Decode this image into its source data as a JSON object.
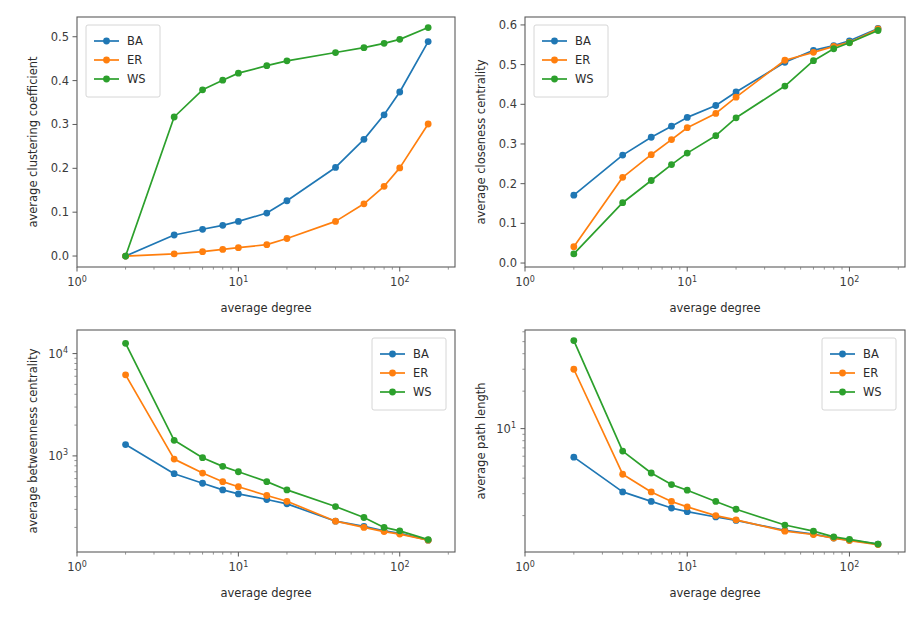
{
  "figure": {
    "background": "#ffffff",
    "width": 918,
    "height": 623,
    "layout": "2x2 grid of line plots"
  },
  "palette": {
    "BA": "#1f77b4",
    "ER": "#ff7f0e",
    "WS": "#2ca02c",
    "axis": "#5b5b5b",
    "text": "#2b2b2b"
  },
  "legend": {
    "entries": [
      "BA",
      "ER",
      "WS"
    ],
    "frame": true
  },
  "chart_data": [
    {
      "id": "clustering",
      "type": "line",
      "title": "",
      "xlabel": "average degree",
      "ylabel": "average clustering coefficient",
      "xscale": "log",
      "yscale": "linear",
      "xlim": [
        1.0,
        220.0
      ],
      "ylim": [
        -0.025,
        0.545
      ],
      "xticks": [
        1,
        10,
        100
      ],
      "xticklabels": [
        "10^0",
        "10^1",
        "10^2"
      ],
      "yticks": [
        0.0,
        0.1,
        0.2,
        0.3,
        0.4,
        0.5
      ],
      "yticklabels": [
        "0.0",
        "0.1",
        "0.2",
        "0.3",
        "0.4",
        "0.5"
      ],
      "grid": false,
      "legend_position": "upper left",
      "x": [
        2,
        4,
        6,
        8,
        10,
        15,
        20,
        40,
        60,
        80,
        100,
        150
      ],
      "series": [
        {
          "name": "BA",
          "color": "#1f77b4",
          "values": [
            0.0,
            0.048,
            0.061,
            0.07,
            0.079,
            0.098,
            0.126,
            0.202,
            0.266,
            0.322,
            0.374,
            0.489
          ]
        },
        {
          "name": "ER",
          "color": "#ff7f0e",
          "values": [
            0.0,
            0.005,
            0.01,
            0.015,
            0.019,
            0.026,
            0.04,
            0.079,
            0.119,
            0.159,
            0.201,
            0.301
          ]
        },
        {
          "name": "WS",
          "color": "#2ca02c",
          "values": [
            0.0,
            0.317,
            0.379,
            0.401,
            0.417,
            0.434,
            0.445,
            0.464,
            0.475,
            0.485,
            0.494,
            0.521
          ]
        }
      ]
    },
    {
      "id": "closeness",
      "type": "line",
      "title": "",
      "xlabel": "average degree",
      "ylabel": "average closeness centrality",
      "xscale": "log",
      "yscale": "linear",
      "xlim": [
        1.0,
        220.0
      ],
      "ylim": [
        -0.01,
        0.62
      ],
      "xticks": [
        1,
        10,
        100
      ],
      "xticklabels": [
        "10^0",
        "10^1",
        "10^2"
      ],
      "yticks": [
        0.0,
        0.1,
        0.2,
        0.3,
        0.4,
        0.5,
        0.6
      ],
      "yticklabels": [
        "0.0",
        "0.1",
        "0.2",
        "0.3",
        "0.4",
        "0.5",
        "0.6"
      ],
      "grid": false,
      "legend_position": "upper left",
      "x": [
        2,
        4,
        6,
        8,
        10,
        15,
        20,
        40,
        60,
        80,
        100,
        150
      ],
      "series": [
        {
          "name": "BA",
          "color": "#1f77b4",
          "values": [
            0.171,
            0.272,
            0.317,
            0.345,
            0.367,
            0.397,
            0.431,
            0.506,
            0.536,
            0.548,
            0.56,
            0.591
          ]
        },
        {
          "name": "ER",
          "color": "#ff7f0e",
          "values": [
            0.041,
            0.216,
            0.273,
            0.311,
            0.341,
            0.377,
            0.418,
            0.511,
            0.531,
            0.546,
            0.556,
            0.59
          ]
        },
        {
          "name": "WS",
          "color": "#2ca02c",
          "values": [
            0.023,
            0.152,
            0.208,
            0.248,
            0.277,
            0.321,
            0.366,
            0.446,
            0.51,
            0.54,
            0.555,
            0.586
          ]
        }
      ]
    },
    {
      "id": "betweenness",
      "type": "line",
      "title": "",
      "xlabel": "average degree",
      "ylabel": "average betweenness centrality",
      "xscale": "log",
      "yscale": "log",
      "xlim": [
        1.0,
        220.0
      ],
      "ylim": [
        115.0,
        17000.0
      ],
      "xticks": [
        1,
        10,
        100
      ],
      "xticklabels": [
        "10^0",
        "10^1",
        "10^2"
      ],
      "yticks": [
        1000,
        10000
      ],
      "yticklabels": [
        "10^3",
        "10^4"
      ],
      "grid": false,
      "legend_position": "upper right",
      "x": [
        2,
        4,
        6,
        8,
        10,
        15,
        20,
        40,
        60,
        80,
        100,
        150
      ],
      "series": [
        {
          "name": "BA",
          "color": "#1f77b4",
          "values": [
            1290,
            670,
            540,
            465,
            425,
            375,
            340,
            230,
            205,
            185,
            175,
            150
          ]
        },
        {
          "name": "ER",
          "color": "#ff7f0e",
          "values": [
            6200,
            930,
            680,
            560,
            500,
            410,
            360,
            230,
            200,
            182,
            172,
            150
          ]
        },
        {
          "name": "WS",
          "color": "#2ca02c",
          "values": [
            12600,
            1420,
            960,
            790,
            700,
            560,
            465,
            320,
            250,
            200,
            185,
            152
          ]
        }
      ]
    },
    {
      "id": "pathlength",
      "type": "line",
      "title": "",
      "xlabel": "average degree",
      "ylabel": "average path length",
      "xscale": "log",
      "yscale": "log",
      "xlim": [
        1.0,
        220.0
      ],
      "ylim": [
        1.02,
        62.0
      ],
      "xticks": [
        1,
        10,
        100
      ],
      "xticklabels": [
        "10^0",
        "10^1",
        "10^2"
      ],
      "yticks": [
        10
      ],
      "yticklabels": [
        "10^1"
      ],
      "grid": false,
      "legend_position": "upper right",
      "x": [
        2,
        4,
        6,
        8,
        10,
        15,
        20,
        40,
        60,
        80,
        100,
        150
      ],
      "series": [
        {
          "name": "BA",
          "color": "#1f77b4",
          "values": [
            5.9,
            3.1,
            2.6,
            2.3,
            2.15,
            1.95,
            1.83,
            1.52,
            1.42,
            1.32,
            1.27,
            1.18
          ]
        },
        {
          "name": "ER",
          "color": "#ff7f0e",
          "values": [
            30.0,
            4.3,
            3.1,
            2.6,
            2.35,
            2.0,
            1.85,
            1.5,
            1.41,
            1.32,
            1.26,
            1.17
          ]
        },
        {
          "name": "WS",
          "color": "#2ca02c",
          "values": [
            51.0,
            6.6,
            4.4,
            3.55,
            3.2,
            2.6,
            2.25,
            1.68,
            1.5,
            1.35,
            1.29,
            1.18
          ]
        }
      ]
    }
  ]
}
